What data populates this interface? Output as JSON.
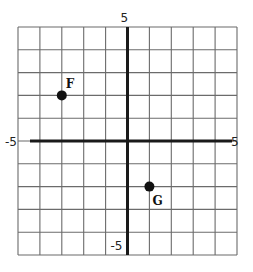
{
  "diagram": {
    "type": "coordinate-plane",
    "x_range": [
      -5,
      5
    ],
    "y_range": [
      -5,
      5
    ],
    "grid_step": 1,
    "axis_labels": {
      "x_min": "-5",
      "x_max": "5",
      "y_min": "-5",
      "y_max": "5"
    },
    "points": [
      {
        "label": "F",
        "x": -3,
        "y": 2,
        "label_position": "upper-right"
      },
      {
        "label": "G",
        "x": 1,
        "y": -2,
        "label_position": "lower-right"
      }
    ],
    "colors": {
      "grid": "#6b6b6b",
      "axis": "#1a1a1a",
      "point": "#111111",
      "background": "#ffffff"
    }
  }
}
